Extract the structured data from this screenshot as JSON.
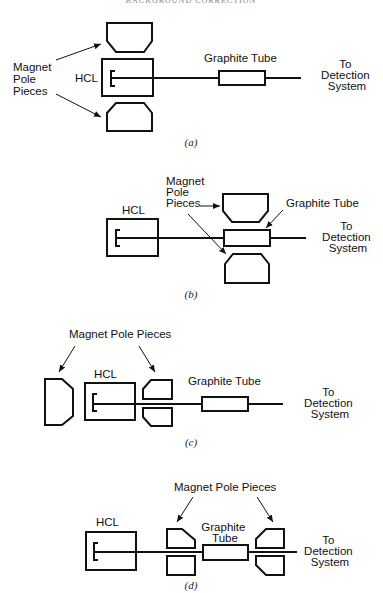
{
  "header": {
    "text": "BACKGROUND CORRECTION"
  },
  "colors": {
    "ink": "#111111",
    "background": "#ffffff"
  },
  "panels": [
    {
      "id": "a",
      "caption": "(a)",
      "labels": {
        "magnet": [
          "Magnet",
          "Pole",
          "Pieces"
        ],
        "hcl": "HCL",
        "graphite": [
          "Graphite Tube"
        ],
        "detection": [
          "To",
          "Detection",
          "System"
        ]
      },
      "description": "Magnet pole pieces above and below the HCL; graphite tube downstream"
    },
    {
      "id": "b",
      "caption": "(b)",
      "labels": {
        "magnet": [
          "Magnet",
          "Pole",
          "Pieces"
        ],
        "hcl": "HCL",
        "graphite": [
          "Graphite Tube"
        ],
        "detection": [
          "To",
          "Detection",
          "System"
        ]
      },
      "description": "Magnet pole pieces above and below the graphite tube"
    },
    {
      "id": "c",
      "caption": "(c)",
      "labels": {
        "magnet": [
          "Magnet Pole Pieces"
        ],
        "hcl": "HCL",
        "graphite": [
          "Graphite Tube"
        ],
        "detection": [
          "To",
          "Detection",
          "System"
        ]
      },
      "description": "Longitudinal magnet pole pieces on either end of the HCL"
    },
    {
      "id": "d",
      "caption": "(d)",
      "labels": {
        "magnet": [
          "Magnet Pole Pieces"
        ],
        "hcl": "HCL",
        "graphite": [
          "Graphite",
          "Tube"
        ],
        "detection": [
          "To",
          "Detection",
          "System"
        ]
      },
      "description": "Longitudinal magnet pole pieces on either end of the graphite tube"
    }
  ]
}
